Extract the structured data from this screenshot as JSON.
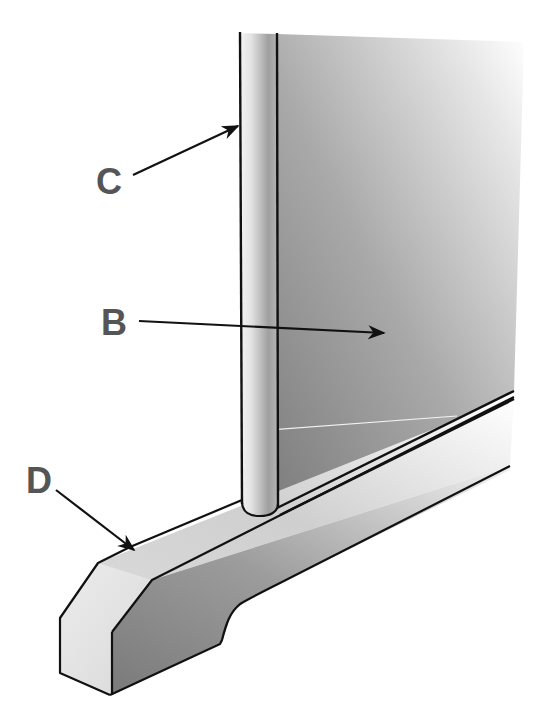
{
  "diagram": {
    "type": "technical-illustration",
    "components": [
      {
        "id": "B",
        "label": "B",
        "description": "panel",
        "color": "#8f8f8f"
      },
      {
        "id": "C",
        "label": "C",
        "description": "vertical edge post / rod",
        "color": "#d8d8d8"
      },
      {
        "id": "D",
        "label": "D",
        "description": "base rail / foot",
        "color": "#e6e6e6"
      }
    ],
    "labels": {
      "b": "B",
      "c": "C",
      "d": "D"
    },
    "colors": {
      "background": "#ffffff",
      "outline": "#111111",
      "label": "#555555",
      "panel_light": "#f2f2f2",
      "panel_dark": "#858585",
      "rail_top": "#e8e8e8",
      "rail_side": "#8a8a8a"
    }
  }
}
